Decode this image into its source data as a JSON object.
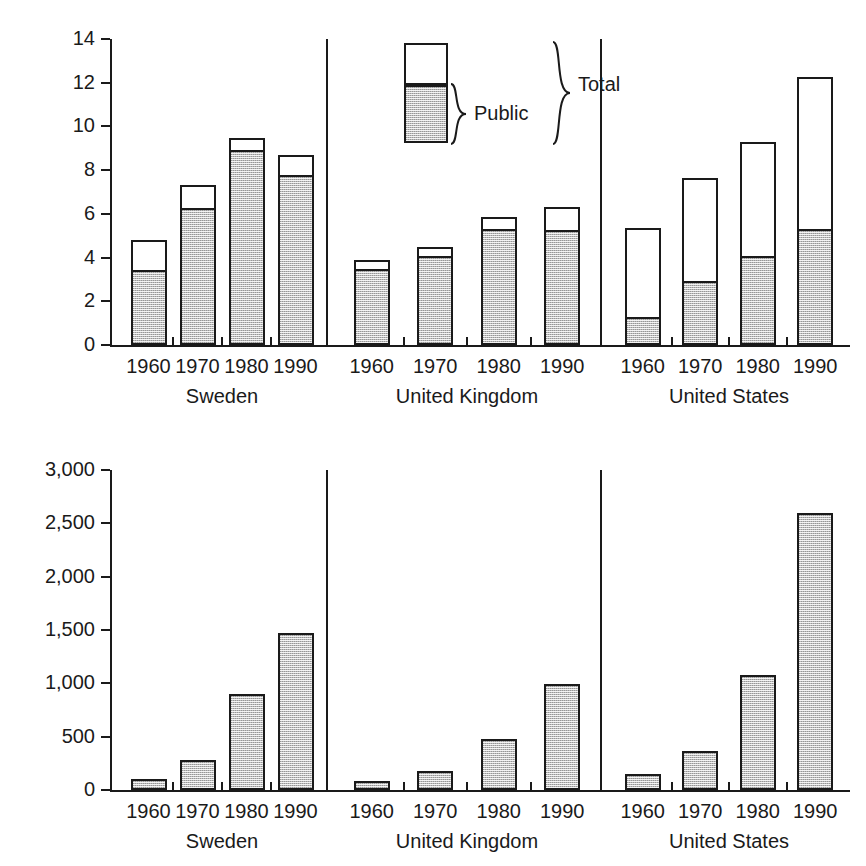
{
  "figure": {
    "background": "#ffffff",
    "bar_fill_color": "#bdbdbd",
    "bar_outline_color": "#1a1a1a"
  },
  "legend": {
    "public_label": "Public",
    "total_label": "Total"
  },
  "chart_data": [
    {
      "type": "bar",
      "id": "health-spending-share-gdp",
      "title": "",
      "xlabel": "",
      "ylabel": "% GDP",
      "ylim": [
        0,
        14
      ],
      "yticks": [
        0,
        2,
        4,
        6,
        8,
        10,
        12,
        14
      ],
      "ytick_labels": [
        "0",
        "2",
        "4",
        "6",
        "8",
        "10",
        "12",
        "14"
      ],
      "grid": false,
      "legend_position": "upper-center",
      "stacked": true,
      "categories": [
        "1960",
        "1970",
        "1980",
        "1990"
      ],
      "groups": [
        "Sweden",
        "United Kingdom",
        "United States"
      ],
      "series": [
        {
          "name": "Public",
          "values": [
            3.45,
            6.25,
            8.9,
            7.8,
            3.5,
            4.05,
            5.3,
            5.25,
            1.3,
            2.95,
            4.05,
            5.3
          ]
        },
        {
          "name": "Total",
          "values": [
            4.8,
            7.3,
            9.45,
            8.7,
            3.9,
            4.5,
            5.85,
            6.3,
            5.35,
            7.65,
            9.3,
            12.25
          ]
        }
      ],
      "group_series": [
        {
          "group": "Sweden",
          "public": [
            3.45,
            6.25,
            8.9,
            7.8
          ],
          "total": [
            4.8,
            7.3,
            9.45,
            8.7
          ]
        },
        {
          "group": "United Kingdom",
          "public": [
            3.5,
            4.05,
            5.3,
            5.25
          ],
          "total": [
            3.9,
            4.5,
            5.85,
            6.3
          ]
        },
        {
          "group": "United States",
          "public": [
            1.3,
            2.95,
            4.05,
            5.3
          ],
          "total": [
            5.35,
            7.65,
            9.3,
            12.25
          ]
        }
      ]
    },
    {
      "type": "bar",
      "id": "health-spending-per-capita",
      "title": "",
      "xlabel": "",
      "ylabel": "US$ per capita",
      "ylim": [
        0,
        3000
      ],
      "yticks": [
        0,
        500,
        1000,
        1500,
        2000,
        2500,
        3000
      ],
      "ytick_labels": [
        "0",
        "500",
        "1,000",
        "1,500",
        "2,000",
        "2,500",
        "3,000"
      ],
      "grid": false,
      "legend_position": "none",
      "stacked": false,
      "categories": [
        "1960",
        "1970",
        "1980",
        "1990"
      ],
      "groups": [
        "Sweden",
        "United Kingdom",
        "United States"
      ],
      "series": [
        {
          "name": "US$ per capita",
          "values": [
            100,
            285,
            900,
            1470,
            80,
            175,
            480,
            990,
            150,
            370,
            1080,
            2600
          ]
        }
      ],
      "group_series": [
        {
          "group": "Sweden",
          "values": [
            100,
            285,
            900,
            1470
          ]
        },
        {
          "group": "United Kingdom",
          "values": [
            80,
            175,
            480,
            990
          ]
        },
        {
          "group": "United States",
          "values": [
            150,
            370,
            1080,
            2600
          ]
        }
      ]
    }
  ]
}
